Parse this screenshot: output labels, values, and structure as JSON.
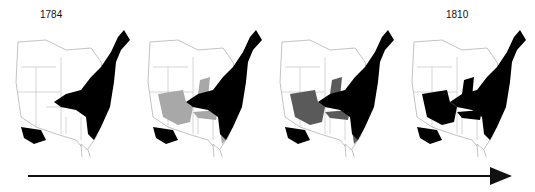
{
  "labels": {
    "start_year": "1784",
    "end_year": "1810"
  },
  "colors": {
    "settled": "#000000",
    "expanding_light": "#a8a8a8",
    "expanding_dark": "#5a5a5a",
    "unsettled": "#ffffff",
    "border": "#999999",
    "arrow": "#111111"
  },
  "maps": [
    {
      "index": 1,
      "caption": "1784",
      "stage": "initial"
    },
    {
      "index": 2,
      "caption": "",
      "stage": "early expansion"
    },
    {
      "index": 3,
      "caption": "",
      "stage": "later expansion"
    },
    {
      "index": 4,
      "caption": "1810",
      "stage": "final"
    }
  ],
  "timeline": {
    "direction": "left-to-right"
  }
}
